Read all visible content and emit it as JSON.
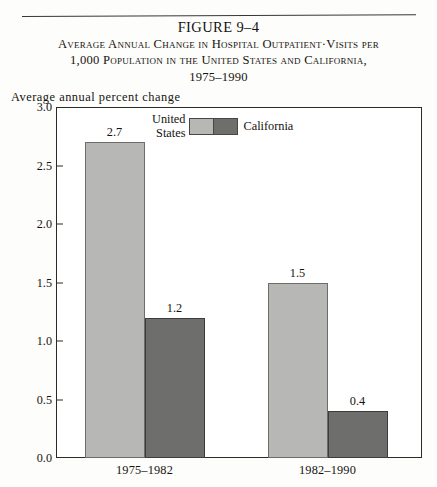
{
  "figure": {
    "number_label": "FIGURE 9–4",
    "subtitle_line1": "Average Annual Change in Hospital Outpatient·Visits per",
    "subtitle_line2": "1,000 Population in the United States and California,",
    "subtitle_line3": "1975–1990"
  },
  "axis_caption": "Average annual percent change",
  "legend": {
    "left_label_line1": "United",
    "left_label_line2": "States",
    "right_label": "California",
    "us_color": "#b7b7b5",
    "ca_color": "#6e6e6c"
  },
  "yticks": [
    "3.0",
    "2.5",
    "2.0",
    "1.5",
    "1.0",
    "0.5",
    "0.0"
  ],
  "chart_data": {
    "type": "bar",
    "title": "Average Annual Change in Hospital Outpatient·Visits per 1,000 Population in the United States and California, 1975–1990",
    "subtitle": "FIGURE 9–4",
    "xlabel": "",
    "ylabel": "Average annual percent change",
    "ylim": [
      0.0,
      3.0
    ],
    "ytick_values": [
      0.0,
      0.5,
      1.0,
      1.5,
      2.0,
      2.5,
      3.0
    ],
    "grid": false,
    "legend_position": "top-center",
    "categories": [
      "1975–1982",
      "1982–1990"
    ],
    "series": [
      {
        "name": "United States",
        "color": "#b7b7b5",
        "values": [
          2.7,
          1.5
        ],
        "value_labels": [
          "2.7",
          "1.5"
        ]
      },
      {
        "name": "California",
        "color": "#6e6e6c",
        "values": [
          1.2,
          0.4
        ],
        "value_labels": [
          "1.2",
          "0.4"
        ]
      }
    ]
  }
}
